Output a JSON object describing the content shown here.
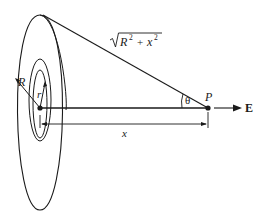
{
  "diagram": {
    "labels": {
      "outer_radius": "R",
      "ring_radius": "r",
      "hypotenuse": "√(R² + x²)",
      "hypotenuse_base": "R",
      "hypotenuse_exp": "2",
      "hypotenuse_plus": "+",
      "hypotenuse_x": "x",
      "hypotenuse_x_exp": "2",
      "angle": "θ",
      "point": "P",
      "field": "E",
      "distance": "x"
    },
    "colors": {
      "stroke": "#1a1a1a",
      "background": "#ffffff"
    }
  }
}
